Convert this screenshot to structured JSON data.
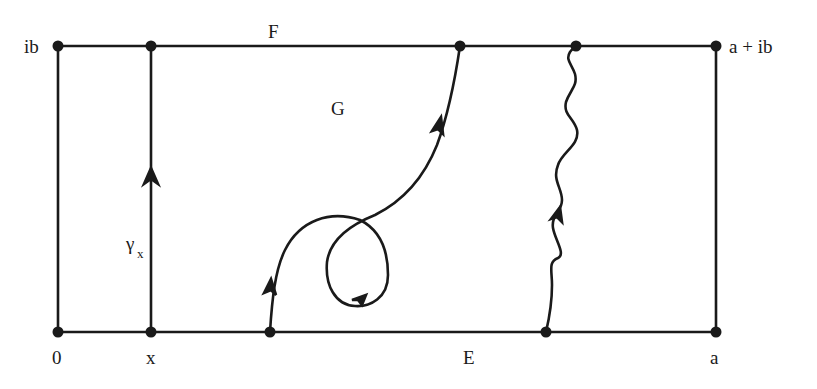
{
  "diagram": {
    "type": "complex-plane rectangle with paths",
    "colors": {
      "stroke": "#1a1a1a",
      "background": "#ffffff"
    },
    "labels": {
      "top_left": "ib",
      "top_right": "a + ib",
      "bottom_left": "0",
      "bottom_x": "x",
      "bottom_right": "a",
      "top_edge": "F",
      "bottom_edge": "E",
      "region": "G",
      "path_gamma": "γ",
      "path_gamma_sub": "x"
    },
    "rectangle": {
      "corners": [
        "0",
        "a",
        "a + ib",
        "ib"
      ]
    },
    "paths": [
      {
        "name": "gamma_x",
        "description": "vertical segment from x to x+ib with upward arrow"
      },
      {
        "name": "looping-path",
        "description": "curve from bottom edge E with a loop, ending at top edge F"
      },
      {
        "name": "wavy-path",
        "description": "wavy curve from bottom edge E to top edge F with upward arrow"
      }
    ]
  }
}
